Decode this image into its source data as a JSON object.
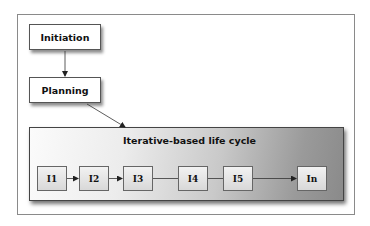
{
  "diagram": {
    "phases": [
      {
        "label": "Initiation"
      },
      {
        "label": "Planning"
      }
    ],
    "iterative_block": {
      "title": "Iterative-based life cycle",
      "iterations": [
        {
          "label": "I1"
        },
        {
          "label": "I2"
        },
        {
          "label": "I3"
        },
        {
          "label": "I4"
        },
        {
          "label": "I5"
        },
        {
          "label": "In"
        }
      ]
    },
    "connections": [
      {
        "from": "Initiation",
        "to": "Planning",
        "type": "arrow"
      },
      {
        "from": "Planning",
        "to": "Iterative-based life cycle",
        "type": "arrow"
      },
      {
        "from": "I1",
        "to": "I2",
        "type": "arrow"
      },
      {
        "from": "I2",
        "to": "I3",
        "type": "arrow"
      },
      {
        "from": "I3",
        "to": "I4",
        "type": "line"
      },
      {
        "from": "I4",
        "to": "I5",
        "type": "line"
      },
      {
        "from": "I5",
        "to": "In",
        "type": "arrow"
      }
    ]
  }
}
